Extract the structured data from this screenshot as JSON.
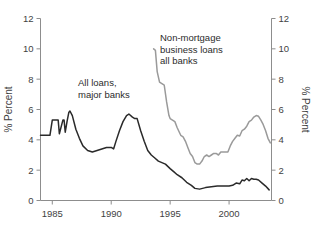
{
  "title_fragment": "..",
  "chart_data": {
    "type": "line",
    "title": "",
    "xlabel": "",
    "ylabel": "% Percent",
    "ylabel_right": "% Percent",
    "xlim": [
      1984.0,
      2003.6
    ],
    "ylim": [
      0,
      12
    ],
    "yticks": [
      0,
      2,
      4,
      6,
      8,
      10,
      12
    ],
    "ytick_labels": [
      "0",
      "2",
      "4",
      "6",
      "8",
      "10",
      "12"
    ],
    "yticks_right": [
      0,
      2,
      4,
      6,
      8,
      10,
      12
    ],
    "ytick_labels_right": [
      "0",
      "2",
      "4",
      "6",
      "8",
      "10",
      "12"
    ],
    "xticks": [
      1985,
      1990,
      1995,
      2000
    ],
    "xtick_labels": [
      "1985",
      "1990",
      "1995",
      "2000"
    ],
    "grid": false,
    "legend_position": "inline-annotations",
    "annotations": [
      {
        "name": "all-loans-major-banks",
        "lines": [
          "All loans,",
          "major banks"
        ],
        "x_px": 78,
        "y_px": 86,
        "color": "#2b2b2b"
      },
      {
        "name": "non-mortgage-business-loans-all-banks",
        "lines": [
          "Non-mortgage",
          "business loans",
          "all banks"
        ],
        "x_px": 160,
        "y_px": 41,
        "color": "#2b2b2b"
      }
    ],
    "series": [
      {
        "name": "All loans, major banks",
        "color": "#2a2a2a",
        "x": [
          1984.0,
          1984.5,
          1984.8,
          1985.0,
          1985.2,
          1985.5,
          1985.6,
          1985.9,
          1986.0,
          1986.1,
          1986.25,
          1986.4,
          1986.5,
          1986.7,
          1987.0,
          1987.3,
          1987.6,
          1988.0,
          1988.4,
          1988.8,
          1989.2,
          1989.6,
          1990.0,
          1990.2,
          1990.4,
          1990.7,
          1991.0,
          1991.3,
          1991.5,
          1991.8,
          1992.0,
          1992.2,
          1992.5,
          1992.8,
          1993.1,
          1993.4,
          1993.7,
          1994.0,
          1994.3,
          1994.6,
          1995.0,
          1995.3,
          1995.6,
          1996.0,
          1996.4,
          1996.8,
          1997.1,
          1997.5,
          1998.0,
          1998.5,
          1999.0,
          1999.4,
          1999.8,
          2000.0,
          2000.3,
          2000.6,
          2000.9,
          2001.1,
          2001.3,
          2001.5,
          2001.7,
          2001.9,
          2002.1,
          2002.3,
          2002.5,
          2002.8,
          2003.1,
          2003.4
        ],
        "y": [
          4.3,
          4.3,
          4.3,
          5.3,
          5.3,
          5.3,
          4.4,
          5.3,
          5.3,
          4.5,
          5.2,
          5.8,
          5.9,
          5.6,
          4.7,
          4.1,
          3.6,
          3.3,
          3.2,
          3.3,
          3.4,
          3.5,
          3.5,
          3.4,
          3.9,
          4.6,
          5.2,
          5.6,
          5.7,
          5.5,
          5.4,
          5.4,
          4.6,
          3.9,
          3.3,
          3.0,
          2.8,
          2.6,
          2.5,
          2.4,
          2.1,
          1.9,
          1.7,
          1.5,
          1.2,
          1.0,
          0.8,
          0.75,
          0.85,
          0.9,
          0.95,
          0.95,
          0.95,
          0.95,
          1.0,
          1.15,
          1.1,
          1.35,
          1.3,
          1.45,
          1.3,
          1.45,
          1.4,
          1.4,
          1.35,
          1.15,
          0.95,
          0.7
        ]
      },
      {
        "name": "Non-mortgage business loans, all banks",
        "color": "#9a9a9a",
        "x": [
          1993.6,
          1993.75,
          1993.9,
          1994.1,
          1994.3,
          1994.5,
          1994.7,
          1994.9,
          1995.0,
          1995.2,
          1995.4,
          1995.6,
          1995.9,
          1996.1,
          1996.3,
          1996.5,
          1996.7,
          1996.9,
          1997.1,
          1997.3,
          1997.5,
          1997.7,
          1997.9,
          1998.1,
          1998.3,
          1998.5,
          1998.7,
          1998.9,
          1999.1,
          1999.3,
          1999.5,
          1999.7,
          1999.9,
          2000.1,
          2000.3,
          2000.5,
          2000.7,
          2000.9,
          2001.1,
          2001.3,
          2001.5,
          2001.7,
          2001.9,
          2002.1,
          2002.3,
          2002.5,
          2002.7,
          2002.9,
          2003.1,
          2003.3,
          2003.5
        ],
        "y": [
          10.0,
          9.9,
          8.5,
          7.8,
          7.7,
          7.6,
          6.5,
          5.6,
          5.4,
          5.3,
          5.2,
          4.8,
          4.3,
          4.2,
          3.9,
          3.5,
          3.1,
          2.9,
          2.5,
          2.4,
          2.4,
          2.6,
          2.9,
          3.0,
          2.9,
          3.0,
          3.1,
          3.1,
          3.0,
          3.2,
          3.2,
          3.2,
          3.2,
          3.6,
          3.9,
          4.1,
          4.3,
          4.25,
          4.6,
          4.7,
          4.9,
          5.2,
          5.3,
          5.5,
          5.6,
          5.55,
          5.3,
          5.0,
          4.6,
          4.1,
          3.8
        ]
      }
    ]
  }
}
